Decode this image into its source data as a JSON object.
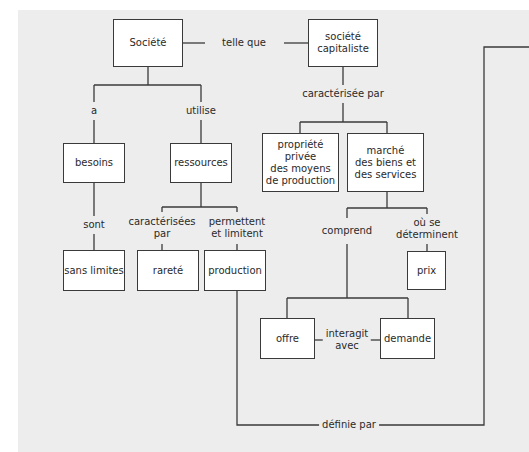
{
  "diagram": {
    "type": "concept-map",
    "colors": {
      "background_panel": "#ededed",
      "box_fill": "#ffffff",
      "line": "#3a3a3a"
    },
    "nodes": {
      "societe": "Société",
      "societe_capitaliste": "société\ncapitaliste",
      "besoins": "besoins",
      "ressources": "ressources",
      "sans_limites": "sans limites",
      "rarete": "rareté",
      "production": "production",
      "propriete_privee": "propriété privée\ndes moyens\nde production",
      "marche": "marché\ndes biens et\ndes services",
      "prix": "prix",
      "offre": "offre",
      "demande": "demande"
    },
    "links": {
      "telle_que": "telle que",
      "a": "a",
      "utilise": "utilise",
      "sont": "sont",
      "caracterisees_par": "caractérisées\npar",
      "permettent_et_limitent": "permettent\net limitent",
      "caracterisee_par": "caractérisée par",
      "comprend": "comprend",
      "ou_se_determinent": "où se\ndéterminent",
      "interagit_avec": "interagit\navec",
      "definie_par": "définie par"
    }
  }
}
